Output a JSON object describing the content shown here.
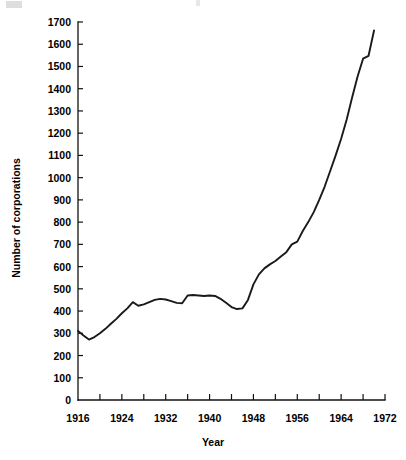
{
  "figure": {
    "background": "#ffffff",
    "line_color": "#1a1a1a",
    "axis_color": "#111111"
  },
  "chart_data": {
    "type": "line",
    "title": "",
    "xlabel": "Year",
    "ylabel": "Number of corporations",
    "xlim": [
      1916,
      1972
    ],
    "ylim": [
      0,
      1700
    ],
    "grid": false,
    "legend": null,
    "x_major_ticks": [
      1916,
      1924,
      1932,
      1940,
      1948,
      1956,
      1964,
      1972
    ],
    "x_minor_ticks": [
      1920,
      1928,
      1936,
      1944,
      1952,
      1960,
      1968
    ],
    "x_tick_labels": [
      "1916",
      "1924",
      "1932",
      "1940",
      "1948",
      "1956",
      "1964",
      "1972"
    ],
    "y_major_ticks": [
      0,
      100,
      200,
      300,
      400,
      500,
      600,
      700,
      800,
      900,
      1000,
      1100,
      1200,
      1300,
      1400,
      1500,
      1600,
      1700
    ],
    "y_tick_labels": [
      "0",
      "100",
      "200",
      "300",
      "400",
      "500",
      "600",
      "700",
      "800",
      "900",
      "1000",
      "1100",
      "1200",
      "1300",
      "1400",
      "1500",
      "1600",
      "1700"
    ],
    "series": [
      {
        "name": "Number of corporations",
        "x": [
          1916,
          1917,
          1918,
          1919,
          1920,
          1921,
          1922,
          1923,
          1924,
          1925,
          1926,
          1927,
          1928,
          1929,
          1930,
          1931,
          1932,
          1933,
          1934,
          1935,
          1936,
          1937,
          1938,
          1939,
          1940,
          1941,
          1942,
          1943,
          1944,
          1945,
          1946,
          1947,
          1948,
          1949,
          1950,
          1951,
          1952,
          1953,
          1954,
          1955,
          1956,
          1957,
          1958,
          1959,
          1960,
          1961,
          1962,
          1963,
          1964,
          1965,
          1966,
          1967,
          1968
        ],
        "y": [
          311,
          290,
          272,
          283,
          300,
          320,
          343,
          365,
          390,
          412,
          440,
          424,
          430,
          440,
          450,
          455,
          452,
          445,
          437,
          435,
          470,
          472,
          470,
          468,
          470,
          468,
          455,
          437,
          418,
          409,
          412,
          450,
          520,
          565,
          592,
          610,
          625,
          645,
          665,
          700,
          712,
          760,
          800,
          845,
          900,
          960,
          1030,
          1100,
          1175,
          1260,
          1360,
          1455,
          1535
        ],
        "y_extra_x": [
          1969,
          1970
        ],
        "y_extra": [
          1548,
          1662
        ]
      }
    ]
  }
}
